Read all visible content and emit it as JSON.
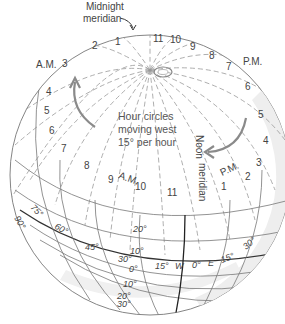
{
  "diagram": {
    "title_labels": {
      "midnight_meridian": [
        "Midnight",
        "meridian"
      ],
      "noon_meridian": [
        "Noon",
        "meridian"
      ],
      "am": "A.M.",
      "pm": "P.M.",
      "am_inner": "A.M.",
      "pm_inner": "P.M."
    },
    "caption": [
      "Hour circles",
      "moving west",
      "15° per hour"
    ],
    "top_hours": [
      "1",
      "11",
      "10",
      "9",
      "8",
      "7",
      "6",
      "2",
      "3",
      "4",
      "5"
    ],
    "am_hours": [
      "1",
      "2",
      "3",
      "4",
      "5",
      "6",
      "7",
      "8",
      "9",
      "10",
      "11"
    ],
    "pm_hours": [
      "1",
      "2",
      "3",
      "4",
      "5",
      "6",
      "7",
      "8",
      "9",
      "10",
      "11"
    ],
    "longitude_labels": [
      "90°",
      "75°",
      "60°",
      "45°",
      "30°",
      "15°",
      "W",
      "0°",
      "E",
      "15°",
      "30°"
    ],
    "latitude_labels": [
      "20°",
      "10°",
      "0°",
      "10°",
      "20°",
      "30°"
    ],
    "colors": {
      "line": "#777777",
      "dashed": "#999999",
      "arrow": "#8a8a8a",
      "shade": "#ececec",
      "equator": "#333333"
    }
  }
}
